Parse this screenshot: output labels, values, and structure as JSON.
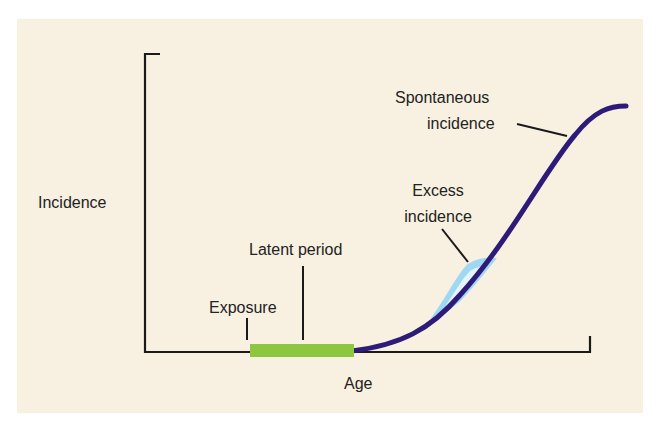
{
  "diagram": {
    "title": "",
    "axes": {
      "y_label": "Incidence",
      "x_label": "Age"
    },
    "annotations": {
      "exposure": "Exposure",
      "latent_period": "Latent period",
      "excess_incidence_line1": "Excess",
      "excess_incidence_line2": "incidence",
      "spontaneous_incidence_line1": "Spontaneous",
      "spontaneous_incidence_line2": "incidence"
    },
    "colors": {
      "background": "#f8f1e1",
      "axis": "#1a1a1a",
      "spontaneous_curve": "#2e1a78",
      "excess_area": "#9fd8f2",
      "latent_bar": "#8dc63f"
    }
  }
}
